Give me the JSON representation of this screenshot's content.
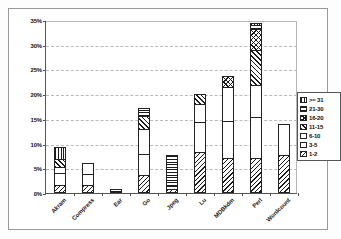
{
  "chart_data": {
    "type": "bar",
    "stacked": true,
    "title": "",
    "subtitle": "",
    "xlabel": "",
    "ylabel": "",
    "ylim": [
      0,
      35
    ],
    "ytick_labels": [
      "0%",
      "5%",
      "10%",
      "15%",
      "20%",
      "25%",
      "30%",
      "35%"
    ],
    "ytick_values": [
      0,
      5,
      10,
      15,
      20,
      25,
      30,
      35
    ],
    "grid": true,
    "legend_position": "right",
    "categories": [
      "Akram",
      "Compress",
      "Ear",
      "Go",
      "Jpeg",
      "Lu",
      "MDBkdm",
      "Perl",
      "Wordcount"
    ],
    "series": [
      {
        "name": "1-2",
        "pattern": "diagonal-hatch-left",
        "values": [
          1.6,
          1.7,
          0.0,
          3.6,
          0.9,
          8.3,
          7.1,
          7.1,
          7.7
        ]
      },
      {
        "name": "3-5",
        "pattern": "solid-white",
        "values": [
          2.4,
          2.1,
          0.0,
          4.2,
          0.5,
          6.1,
          7.5,
          8.3,
          6.3
        ]
      },
      {
        "name": "6-10",
        "pattern": "dotted",
        "values": [
          1.2,
          2.2,
          0.0,
          5.2,
          0.0,
          3.6,
          6.9,
          6.5,
          0.0
        ]
      },
      {
        "name": "11-15",
        "pattern": "diagonal-hatch-right",
        "values": [
          1.7,
          0.0,
          0.0,
          2.6,
          0.0,
          2.1,
          0.0,
          7.0,
          0.0
        ]
      },
      {
        "name": "16-20",
        "pattern": "cross-hatch",
        "values": [
          0.0,
          0.0,
          0.0,
          0.0,
          0.0,
          0.0,
          2.2,
          4.3,
          0.0
        ]
      },
      {
        "name": "21-30",
        "pattern": "horizontal-lines",
        "values": [
          0.0,
          0.0,
          0.9,
          1.7,
          6.3,
          0.0,
          0.0,
          0.7,
          0.0
        ]
      },
      {
        "name": ">= 31",
        "pattern": "vertical-lines",
        "values": [
          2.5,
          0.0,
          0.0,
          0.0,
          0.0,
          0.0,
          0.0,
          0.5,
          0.0
        ]
      }
    ],
    "totals": [
      9.4,
      6.0,
      0.9,
      17.3,
      7.7,
      20.1,
      23.7,
      34.4,
      14.0
    ]
  },
  "legend": {
    "items": [
      {
        "label": ">= 31"
      },
      {
        "label": "21-30"
      },
      {
        "label": "16-20"
      },
      {
        "label": "11-15"
      },
      {
        "label": "6-10"
      },
      {
        "label": "3-5"
      },
      {
        "label": "1-2"
      }
    ]
  }
}
